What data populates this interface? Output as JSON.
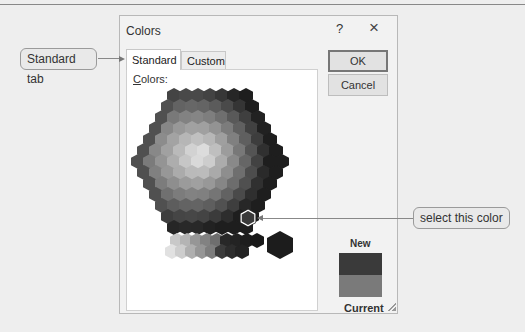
{
  "dialog": {
    "title": "Colors",
    "help_label": "?",
    "close_label": "×",
    "tabs": [
      {
        "label": "Standard",
        "active": true
      },
      {
        "label": "Custom",
        "active": false
      }
    ],
    "colors_label_prefix": "C",
    "colors_label_rest": "olors:",
    "ok_label": "OK",
    "cancel_label": "Cancel",
    "new_label": "New",
    "current_label": "Current",
    "new_color": "#3a3a3a",
    "current_color": "#7a7a7a"
  },
  "callouts": {
    "standard_tab": "Standard tab",
    "select_color": "select this color"
  },
  "icons": {
    "help": "question-icon",
    "close": "close-icon",
    "resize": "resize-grip-icon"
  }
}
